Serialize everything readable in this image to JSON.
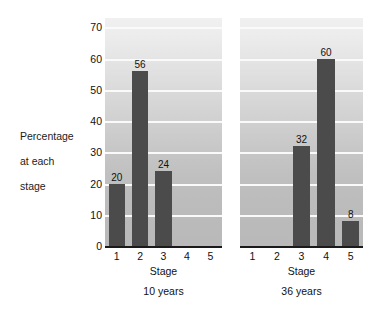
{
  "chart_data": {
    "type": "bar",
    "title": "",
    "subtitle": "",
    "xlabel": "Stage",
    "ylabel": "Percentage at each stage",
    "ylim": [
      0,
      73
    ],
    "yticks": [
      0,
      10,
      20,
      30,
      40,
      50,
      60,
      70
    ],
    "ytick_labels": [
      "0",
      "10",
      "20",
      "30",
      "40",
      "50",
      "60",
      "70"
    ],
    "grid": true,
    "legend_position": "none",
    "categories": [
      "1",
      "2",
      "3",
      "4",
      "5"
    ],
    "panels": [
      {
        "caption": "10 years",
        "xlabel": "Stage",
        "categories": [
          "1",
          "2",
          "3",
          "4",
          "5"
        ],
        "values": [
          20,
          56,
          24,
          0,
          0
        ],
        "labels": [
          "20",
          "56",
          "24",
          "",
          ""
        ]
      },
      {
        "caption": "36 years",
        "xlabel": "Stage",
        "categories": [
          "1",
          "2",
          "3",
          "4",
          "5"
        ],
        "values": [
          0,
          0,
          32,
          60,
          8
        ],
        "labels": [
          "",
          "",
          "32",
          "60",
          "8"
        ]
      }
    ],
    "colors": {
      "bar": "#4b4b4b",
      "gridline": "#fafafa",
      "axis": "#1a1a1a",
      "plot_background_top": "#f0f0f0",
      "plot_background_bottom": "#b9b9b9",
      "text": "#111111"
    }
  },
  "axis": {
    "y_label_line1": "Percentage",
    "y_label_line2": "at each",
    "y_label_line3": "stage"
  }
}
